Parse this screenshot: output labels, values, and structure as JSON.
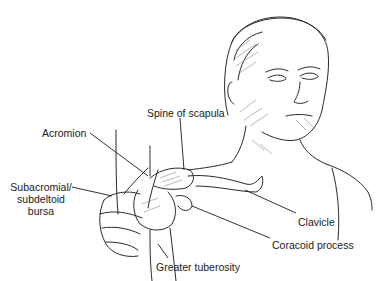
{
  "diagram": {
    "labels": {
      "spine_of_scapula": "Spine of scapula",
      "acromion": "Acromion",
      "bursa_line1": "Subacromial/",
      "bursa_line2": "subdeltoid",
      "bursa_line3": "bursa",
      "clavicle": "Clavicle",
      "coracoid_process": "Coracoid process",
      "greater_tuberosity": "Greater tuberosity"
    },
    "colors": {
      "line": "#1a1a1a",
      "shade": "#8a8a8a",
      "background": "#ffffff"
    }
  }
}
